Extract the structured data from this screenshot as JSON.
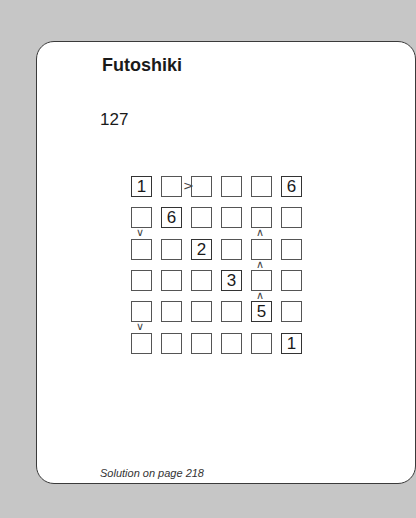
{
  "page": {
    "title": "Futoshiki",
    "puzzle_number": "127",
    "footer": "Solution on page 218"
  },
  "puzzle": {
    "size": 6,
    "grid": [
      [
        "1",
        "",
        "",
        "",
        "",
        "6"
      ],
      [
        "",
        "6",
        "",
        "",
        "",
        ""
      ],
      [
        "",
        "",
        "2",
        "",
        "",
        ""
      ],
      [
        "",
        "",
        "",
        "3",
        "",
        ""
      ],
      [
        "",
        "",
        "",
        "",
        "5",
        ""
      ],
      [
        "",
        "",
        "",
        "",
        "",
        "1"
      ]
    ],
    "constraints": [
      {
        "type": "horizontal",
        "row": 0,
        "between_cols": [
          1,
          2
        ],
        "symbol": ">"
      },
      {
        "type": "vertical",
        "col": 0,
        "between_rows": [
          1,
          2
        ],
        "symbol": "v"
      },
      {
        "type": "vertical",
        "col": 4,
        "between_rows": [
          1,
          2
        ],
        "symbol": "^"
      },
      {
        "type": "vertical",
        "col": 4,
        "between_rows": [
          2,
          3
        ],
        "symbol": "^"
      },
      {
        "type": "vertical",
        "col": 4,
        "between_rows": [
          3,
          4
        ],
        "symbol": "^"
      },
      {
        "type": "vertical",
        "col": 0,
        "between_rows": [
          4,
          5
        ],
        "symbol": "v"
      }
    ]
  },
  "colors": {
    "background": "#c6c6c6",
    "card": "#ffffff",
    "border": "#3a3a3a",
    "text": "#1a1a1a"
  }
}
